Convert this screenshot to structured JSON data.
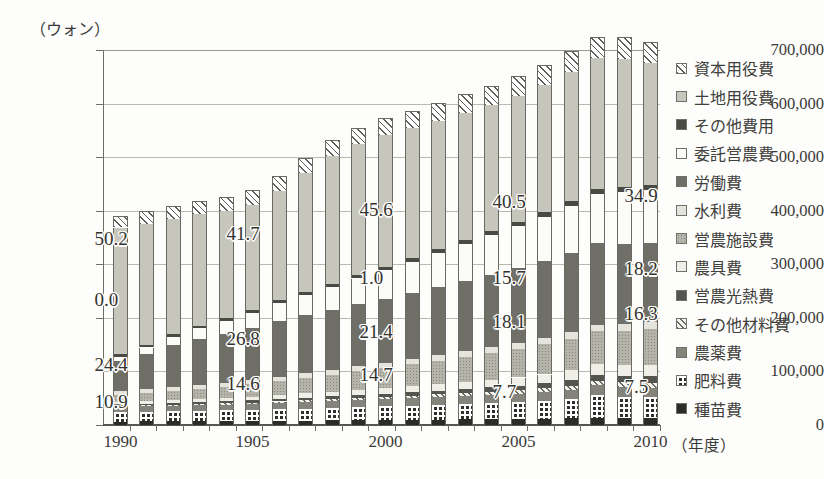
{
  "chart_data": {
    "type": "bar",
    "title": "",
    "subtitle": "",
    "stacked": true,
    "ylabel": "（ウォン）",
    "xlabel": "（年度）",
    "ylim": [
      0,
      700000
    ],
    "ytick_values": [
      700000,
      600000,
      500000,
      400000,
      300000,
      200000,
      100000,
      0
    ],
    "ytick_labels": [
      "700,000",
      "600,000",
      "500,000",
      "400,000",
      "300,000",
      "200,000",
      "100,000",
      "0"
    ],
    "grid": true,
    "legend_position": "right",
    "xtick_labels": [
      "1990",
      "1905",
      "2000",
      "2005",
      "2010"
    ],
    "xtick_categories": [
      "1990",
      "1995",
      "2000",
      "2005",
      "2010"
    ],
    "categories": [
      "1990",
      "1991",
      "1992",
      "1993",
      "1994",
      "1995",
      "1996",
      "1997",
      "1998",
      "1999",
      "2000",
      "2001",
      "2002",
      "2003",
      "2004",
      "2005",
      "2006",
      "2007",
      "2008",
      "2009",
      "2010"
    ],
    "series": [
      {
        "name": "種苗費",
        "key": "shubyo",
        "values": [
          6500,
          6700,
          6900,
          7100,
          7300,
          7600,
          7900,
          8200,
          8600,
          9000,
          9400,
          9800,
          10200,
          10600,
          11000,
          11400,
          11800,
          12200,
          12600,
          13000,
          13400
        ]
      },
      {
        "name": "肥料費",
        "key": "hiryo",
        "values": [
          18000,
          18500,
          19000,
          19500,
          20000,
          20500,
          21500,
          22500,
          23500,
          24500,
          25500,
          26500,
          27500,
          28500,
          29500,
          31000,
          33000,
          37000,
          44000,
          40000,
          38000
        ]
      },
      {
        "name": "農薬費",
        "key": "nouyaku",
        "values": [
          9000,
          9400,
          9800,
          10200,
          10600,
          11000,
          11500,
          12000,
          12500,
          13000,
          13500,
          14000,
          14500,
          15000,
          15500,
          16000,
          16500,
          17000,
          17500,
          18000,
          18500
        ]
      },
      {
        "name": "その他材料費",
        "key": "zairyo",
        "values": [
          2200,
          2300,
          2400,
          2500,
          2600,
          2800,
          3000,
          3200,
          3500,
          3800,
          4200,
          4600,
          5000,
          5500,
          6000,
          6500,
          7000,
          7500,
          8000,
          8500,
          9000
        ]
      },
      {
        "name": "営農光熱費",
        "key": "kounetsu",
        "values": [
          3000,
          3200,
          3400,
          3600,
          3800,
          4000,
          4400,
          4800,
          5200,
          5600,
          6000,
          6500,
          7000,
          7600,
          8200,
          8800,
          9500,
          10500,
          11500,
          12000,
          12500
        ]
      },
      {
        "name": "農具費",
        "key": "nougu",
        "values": [
          5000,
          5400,
          5800,
          6200,
          6600,
          7000,
          7600,
          8200,
          8800,
          9400,
          10000,
          11000,
          12000,
          13000,
          14000,
          15000,
          16500,
          18000,
          19500,
          20500,
          21500
        ]
      },
      {
        "name": "営農施設費",
        "key": "shisetsu",
        "values": [
          12000,
          14000,
          16000,
          18000,
          20000,
          23000,
          26000,
          29000,
          32000,
          35000,
          38000,
          41000,
          44000,
          47000,
          50000,
          53000,
          56000,
          59000,
          62000,
          64000,
          66000
        ]
      },
      {
        "name": "水利費",
        "key": "suiri",
        "values": [
          7000,
          7200,
          7400,
          7600,
          7800,
          8000,
          8300,
          8600,
          8900,
          9200,
          9500,
          9800,
          10100,
          10400,
          10700,
          11000,
          11300,
          11600,
          11900,
          12200,
          12500
        ]
      },
      {
        "name": "労働費",
        "key": "roudou",
        "values": [
          56000,
          66000,
          78000,
          86000,
          92000,
          98000,
          104000,
          108000,
          112000,
          116000,
          120000,
          124000,
          128000,
          132000,
          136000,
          140000,
          144000,
          148000,
          152000,
          150000,
          148000
        ]
      },
      {
        "name": "委託営農費",
        "key": "itaku",
        "values": [
          9000,
          12000,
          16000,
          20000,
          24000,
          28000,
          33000,
          38000,
          43000,
          48000,
          53000,
          58000,
          63000,
          68000,
          73000,
          78000,
          83000,
          88000,
          93000,
          96000,
          99000
        ]
      },
      {
        "name": "その他費用",
        "key": "sonotahi",
        "values": [
          4000,
          4200,
          4400,
          4600,
          4800,
          5000,
          5300,
          5600,
          5900,
          6200,
          6500,
          6800,
          7100,
          7400,
          7700,
          8000,
          8300,
          8600,
          8900,
          9200,
          9500
        ]
      },
      {
        "name": "土地用役費",
        "key": "tochi",
        "values": [
          237000,
          227000,
          216000,
          208000,
          200000,
          196000,
          204000,
          222000,
          238000,
          244000,
          246000,
          242000,
          239000,
          237000,
          236000,
          236000,
          238000,
          241000,
          244000,
          240000,
          227000
        ]
      },
      {
        "name": "資本用役費",
        "key": "shihon",
        "values": [
          22000,
          23000,
          24000,
          25000,
          26000,
          27000,
          28000,
          29000,
          30000,
          31000,
          32000,
          33000,
          34000,
          35000,
          36000,
          37000,
          38000,
          39000,
          40000,
          40000,
          40000
        ]
      }
    ],
    "totals": [
      390700,
      399900,
      411100,
      424800,
      435000,
      452900,
      481500,
      518100,
      557600,
      577700,
      597600,
      601000,
      611400,
      621500,
      628600,
      640700,
      659900,
      685400,
      713400,
      703900,
      692400
    ],
    "annotations": [
      {
        "text": "50.2",
        "category": "1990",
        "x_index": 0
      },
      {
        "text": "0.0",
        "category": "1990",
        "x_index": 0
      },
      {
        "text": "24.4",
        "category": "1990",
        "x_index": 0
      },
      {
        "text": "10.9",
        "category": "1990",
        "x_index": 0
      },
      {
        "text": "41.7",
        "category": "1995",
        "x_index": 5
      },
      {
        "text": "26.8",
        "category": "1995",
        "x_index": 5
      },
      {
        "text": "14.6",
        "category": "1995",
        "x_index": 5
      },
      {
        "text": "45.6",
        "category": "2000",
        "x_index": 10
      },
      {
        "text": "1.0",
        "category": "2000",
        "x_index": 10
      },
      {
        "text": "21.4",
        "category": "2000",
        "x_index": 10
      },
      {
        "text": "14.7",
        "category": "2000",
        "x_index": 10
      },
      {
        "text": "40.5",
        "category": "2005",
        "x_index": 15
      },
      {
        "text": "15.7",
        "category": "2005",
        "x_index": 15
      },
      {
        "text": "18.1",
        "category": "2005",
        "x_index": 15
      },
      {
        "text": "7.7",
        "category": "2005",
        "x_index": 15
      },
      {
        "text": "34.9",
        "category": "2010",
        "x_index": 20
      },
      {
        "text": "18.2",
        "category": "2010",
        "x_index": 20
      },
      {
        "text": "16.3",
        "category": "2010",
        "x_index": 20
      },
      {
        "text": "7.5",
        "category": "2010",
        "x_index": 20
      }
    ],
    "colors": {
      "shihon": "#5e5e58",
      "tochi": "#c6c6bd",
      "sonotahi": "#4a4a45",
      "itaku": "#fbfbf7",
      "roudou": "#6f6f68",
      "suiri": "#e4e4dc",
      "shisetsu": "#b4b4aa",
      "nougu": "#efefe8",
      "kounetsu": "#55554f",
      "zairyo": "#6b6b63",
      "nouyaku": "#84847c",
      "hiryo": "#2e2e2a",
      "shubyo": "#2b2b27",
      "axis": "#55554f",
      "grid": "#b9b9b0",
      "text": "#3a3a38"
    }
  },
  "legend": {
    "items": [
      {
        "label": "資本用役費",
        "key": "shihon"
      },
      {
        "label": "土地用役費",
        "key": "tochi"
      },
      {
        "label": "その他費用",
        "key": "sonotahi"
      },
      {
        "label": "委託営農費",
        "key": "itaku"
      },
      {
        "label": "労働費",
        "key": "roudou"
      },
      {
        "label": "水利費",
        "key": "suiri"
      },
      {
        "label": "営農施設費",
        "key": "shisetsu"
      },
      {
        "label": "農具費",
        "key": "nougu"
      },
      {
        "label": "営農光熱費",
        "key": "kounetsu"
      },
      {
        "label": "その他材料費",
        "key": "zairyo"
      },
      {
        "label": "農薬費",
        "key": "nouyaku"
      },
      {
        "label": "肥料費",
        "key": "hiryo"
      },
      {
        "label": "種苗費",
        "key": "shubyo"
      }
    ]
  }
}
